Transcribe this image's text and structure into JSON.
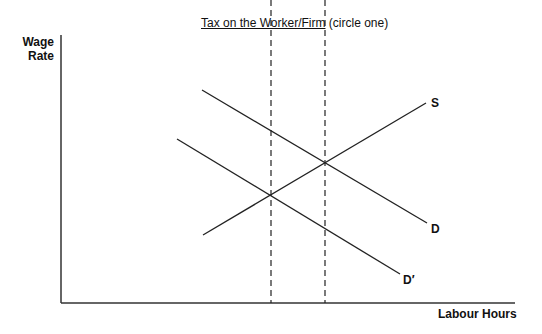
{
  "title": {
    "underlined": "Tax on the Worker/Firm",
    "suffix": " (circle one)"
  },
  "axes": {
    "y_label_line1": "Wage",
    "y_label_line2": "Rate",
    "x_label": "Labour Hours"
  },
  "curves": {
    "supply": "S",
    "demand": "D",
    "demand_shifted": "D′"
  },
  "colors": {
    "line": "#222222",
    "background": "#ffffff"
  }
}
